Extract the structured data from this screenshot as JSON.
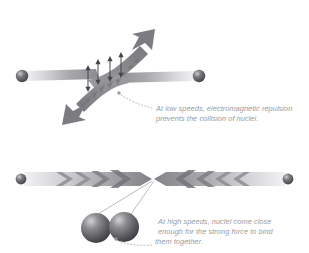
{
  "figure": {
    "background_color": "#ffffff",
    "width": 309,
    "height": 253
  },
  "panels": [
    {
      "id": "low-speed",
      "name": "low-speed-panel",
      "caption": {
        "lines": [
          "At low speeds, electromagnetic repulsion",
          "prevents the collision of nuclei."
        ],
        "color": "#9a9a9e"
      },
      "elements": {
        "left_nucleus_label": "nucleus",
        "right_nucleus_label": "nucleus",
        "incoming_beams": 2,
        "deflected_beams": 2,
        "repulsion_arrows": 4,
        "repulsion_arrow_label": "electromagnetic repulsion"
      }
    },
    {
      "id": "high-speed",
      "name": "high-speed-panel",
      "caption": {
        "lines": [
          "At high speeds, nuclei come close",
          "enough for the strong force to bind",
          "them together."
        ],
        "color": "#9a9a9e"
      },
      "elements": {
        "left_nucleus_label": "nucleus",
        "right_nucleus_label": "nucleus",
        "converging_beams": 2,
        "bound_nuclei": 2,
        "bound_nuclei_label": "bound nuclei"
      }
    }
  ],
  "colors": {
    "beam_dark": "#85858a",
    "beam_mid": "#a8a8ad",
    "beam_light": "#e8e8ea",
    "arrow_stroke": "#4a4a4e",
    "nucleus_dark": "#4e4e52",
    "nucleus_light": "#b8b8bd",
    "caption_text": "#9a9a9e",
    "leader_line": "#b4b4b8"
  }
}
